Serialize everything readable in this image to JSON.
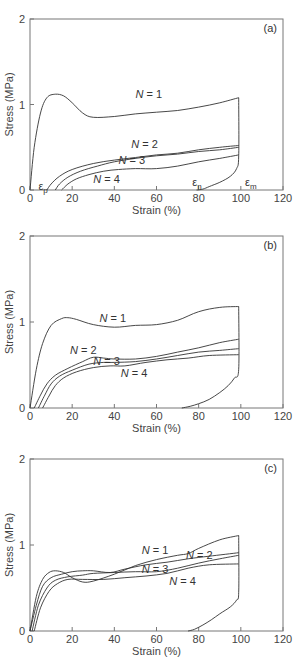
{
  "chart_data": [
    {
      "type": "line",
      "panel": "(a)",
      "xlabel": "Strain (%)",
      "ylabel": "Stress (MPa)",
      "xlim": [
        0,
        120
      ],
      "ylim": [
        0,
        2
      ],
      "xticks": [
        0,
        20,
        40,
        60,
        80,
        100,
        120
      ],
      "yticks": [
        0,
        1,
        2
      ],
      "grid": false,
      "legend": "inline labels",
      "annotations": [
        {
          "text": "ε",
          "sub": "p",
          "x": 4,
          "y": -0.02
        },
        {
          "text": "ε",
          "sub": "n",
          "x": 77,
          "y": 0.02
        },
        {
          "text": "ε",
          "sub": "m",
          "x": 102,
          "y": 0.02
        }
      ],
      "series": [
        {
          "name": "N = 1",
          "label_pos": [
            50,
            1.08
          ],
          "x": [
            0,
            2,
            5,
            8,
            12,
            16,
            20,
            25,
            30,
            40,
            50,
            60,
            70,
            80,
            90,
            99
          ],
          "y": [
            0,
            0.5,
            0.9,
            1.08,
            1.12,
            1.1,
            1.02,
            0.9,
            0.85,
            0.86,
            0.89,
            0.91,
            0.93,
            0.97,
            1.02,
            1.08
          ]
        },
        {
          "name": "N = 2",
          "label_pos": [
            48,
            0.49
          ],
          "x": [
            8,
            10,
            14,
            20,
            30,
            40,
            50,
            60,
            70,
            80,
            90,
            99
          ],
          "y": [
            0,
            0.07,
            0.16,
            0.24,
            0.31,
            0.35,
            0.38,
            0.41,
            0.43,
            0.47,
            0.5,
            0.52
          ]
        },
        {
          "name": "N = 3",
          "label_pos": [
            42,
            0.3
          ],
          "x": [
            12,
            14,
            18,
            24,
            32,
            40,
            50,
            60,
            70,
            80,
            90,
            99
          ],
          "y": [
            0,
            0.07,
            0.15,
            0.22,
            0.28,
            0.33,
            0.37,
            0.4,
            0.42,
            0.45,
            0.47,
            0.5
          ]
        },
        {
          "name": "N = 4",
          "label_pos": [
            30,
            0.08
          ],
          "x": [
            15,
            18,
            22,
            28,
            35,
            42,
            50,
            60,
            70,
            80,
            90,
            99
          ],
          "y": [
            0,
            0.07,
            0.13,
            0.18,
            0.22,
            0.24,
            0.25,
            0.25,
            0.28,
            0.33,
            0.37,
            0.41
          ]
        },
        {
          "name": "unload",
          "label_pos": null,
          "x": [
            99,
            99,
            98,
            95,
            90,
            85,
            82,
            79
          ],
          "y": [
            1.08,
            0.4,
            0.25,
            0.16,
            0.09,
            0.04,
            0.01,
            0
          ]
        }
      ]
    },
    {
      "type": "line",
      "panel": "(b)",
      "xlabel": "Strain (%)",
      "ylabel": "Stress (MPa)",
      "xlim": [
        0,
        120
      ],
      "ylim": [
        0,
        2
      ],
      "xticks": [
        0,
        20,
        40,
        60,
        80,
        100,
        120
      ],
      "yticks": [
        0,
        1,
        2
      ],
      "grid": false,
      "legend": "inline labels",
      "annotations": [],
      "series": [
        {
          "name": "N = 1",
          "label_pos": [
            33,
            1.0
          ],
          "x": [
            0,
            3,
            6,
            10,
            15,
            18,
            22,
            30,
            40,
            50,
            60,
            70,
            80,
            90,
            99
          ],
          "y": [
            0,
            0.45,
            0.75,
            0.96,
            1.04,
            1.05,
            1.03,
            0.97,
            0.94,
            0.96,
            0.97,
            1.02,
            1.12,
            1.17,
            1.18
          ]
        },
        {
          "name": "N = 2",
          "label_pos": [
            19,
            0.63
          ],
          "x": [
            2,
            5,
            8,
            12,
            18,
            25,
            30,
            35,
            40,
            50,
            60,
            70,
            80,
            90,
            99
          ],
          "y": [
            0,
            0.15,
            0.28,
            0.38,
            0.46,
            0.54,
            0.59,
            0.58,
            0.57,
            0.57,
            0.6,
            0.65,
            0.7,
            0.76,
            0.8
          ]
        },
        {
          "name": "N = 3",
          "label_pos": [
            30,
            0.5
          ],
          "x": [
            4,
            7,
            10,
            14,
            20,
            28,
            35,
            40,
            50,
            60,
            70,
            80,
            90,
            99
          ],
          "y": [
            0,
            0.15,
            0.28,
            0.37,
            0.44,
            0.51,
            0.53,
            0.53,
            0.54,
            0.57,
            0.61,
            0.65,
            0.67,
            0.69
          ]
        },
        {
          "name": "N = 4",
          "label_pos": [
            43,
            0.36
          ],
          "x": [
            6,
            9,
            12,
            16,
            22,
            30,
            38,
            45,
            55,
            65,
            75,
            85,
            99
          ],
          "y": [
            0,
            0.14,
            0.26,
            0.35,
            0.42,
            0.47,
            0.49,
            0.49,
            0.53,
            0.56,
            0.58,
            0.61,
            0.62
          ]
        },
        {
          "name": "unload",
          "label_pos": null,
          "x": [
            99,
            99,
            97,
            94,
            90,
            85,
            80,
            76,
            72
          ],
          "y": [
            1.18,
            0.45,
            0.35,
            0.26,
            0.18,
            0.1,
            0.05,
            0.02,
            0
          ]
        }
      ]
    },
    {
      "type": "line",
      "panel": "(c)",
      "xlabel": "Strain (%)",
      "ylabel": "Stress (MPa)",
      "xlim": [
        0,
        120
      ],
      "ylim": [
        0,
        2
      ],
      "xticks": [
        0,
        20,
        40,
        60,
        80,
        100,
        120
      ],
      "yticks": [
        0,
        1,
        2
      ],
      "grid": false,
      "legend": "inline labels",
      "annotations": [],
      "series": [
        {
          "name": "N = 1",
          "label_pos": [
            53,
            0.9
          ],
          "x": [
            0,
            3,
            6,
            9,
            12,
            16,
            20,
            25,
            30,
            40,
            50,
            60,
            70,
            75,
            80,
            90,
            99
          ],
          "y": [
            0,
            0.4,
            0.6,
            0.68,
            0.7,
            0.68,
            0.62,
            0.57,
            0.58,
            0.66,
            0.76,
            0.83,
            0.88,
            0.9,
            0.96,
            1.06,
            1.11
          ]
        },
        {
          "name": "N = 2",
          "label_pos": [
            74,
            0.84
          ],
          "x": [
            0,
            3,
            6,
            10,
            15,
            20,
            25,
            30,
            38,
            45,
            55,
            65,
            75,
            85,
            99
          ],
          "y": [
            0,
            0.3,
            0.52,
            0.62,
            0.66,
            0.69,
            0.7,
            0.7,
            0.68,
            0.72,
            0.77,
            0.8,
            0.84,
            0.87,
            0.91
          ]
        },
        {
          "name": "N = 3",
          "label_pos": [
            53,
            0.67
          ],
          "x": [
            1,
            4,
            8,
            12,
            18,
            25,
            30,
            40,
            50,
            60,
            70,
            80,
            90,
            99
          ],
          "y": [
            0,
            0.3,
            0.5,
            0.59,
            0.63,
            0.65,
            0.67,
            0.68,
            0.69,
            0.69,
            0.73,
            0.79,
            0.84,
            0.88
          ]
        },
        {
          "name": "N = 4",
          "label_pos": [
            66,
            0.53
          ],
          "x": [
            2,
            5,
            9,
            13,
            18,
            25,
            35,
            45,
            55,
            65,
            75,
            85,
            99
          ],
          "y": [
            0,
            0.27,
            0.46,
            0.55,
            0.6,
            0.6,
            0.6,
            0.62,
            0.64,
            0.67,
            0.73,
            0.77,
            0.78
          ]
        },
        {
          "name": "unload",
          "label_pos": null,
          "x": [
            99,
            99,
            98,
            95,
            90,
            86,
            82,
            78,
            75
          ],
          "y": [
            1.11,
            0.45,
            0.36,
            0.28,
            0.2,
            0.13,
            0.07,
            0.02,
            0
          ]
        }
      ]
    }
  ]
}
